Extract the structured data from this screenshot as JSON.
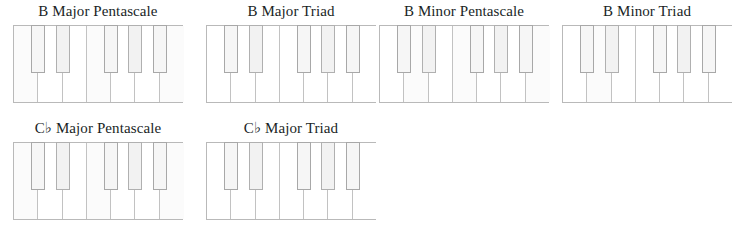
{
  "page": {
    "background_color": "#ffffff",
    "text_color": "#201f1f",
    "white_key_color": "#ffffff",
    "black_key_color": "#f2f2f2",
    "key_border_color": "#b9b9b9"
  },
  "layout": {
    "rows": 2,
    "columns_row1": 4,
    "columns_row2": 2,
    "keyboard_white_keys": 7,
    "keyboard_black_keys": 5
  },
  "diagrams": [
    {
      "id": "b-major-pentascale",
      "title": "B Major Pentascale",
      "root": "B",
      "quality": "Major",
      "kind": "Pentascale",
      "left": 13,
      "top": 2,
      "notes": [
        "B",
        "C♯",
        "D♯",
        "E",
        "F♯"
      ],
      "white_keys_on": [
        0,
        3,
        6
      ],
      "black_keys_on": [
        0,
        2,
        4
      ]
    },
    {
      "id": "b-major-triad",
      "title": "B Major Triad",
      "root": "B",
      "quality": "Major",
      "kind": "Triad",
      "left": 206,
      "top": 2,
      "notes": [
        "B",
        "D♯",
        "F♯"
      ],
      "white_keys_on": [],
      "black_keys_on": [
        0,
        2,
        4
      ]
    },
    {
      "id": "b-minor-pentascale",
      "title": "B Minor Pentascale",
      "root": "B",
      "quality": "Minor",
      "kind": "Pentascale",
      "left": 379,
      "top": 2,
      "notes": [
        "B",
        "C♯",
        "D",
        "E",
        "F♯"
      ],
      "white_keys_on": [
        1,
        3,
        6
      ],
      "black_keys_on": [
        0,
        2,
        4
      ]
    },
    {
      "id": "b-minor-triad",
      "title": "B Minor Triad",
      "root": "B",
      "quality": "Minor",
      "kind": "Triad",
      "left": 562,
      "top": 2,
      "notes": [
        "B",
        "D",
        "F♯"
      ],
      "white_keys_on": [
        1
      ],
      "black_keys_on": [
        0,
        2,
        4
      ]
    },
    {
      "id": "cb-major-pentascale",
      "title": "C♭ Major Pentascale",
      "root": "C♭",
      "quality": "Major",
      "kind": "Pentascale",
      "left": 13,
      "top": 119,
      "notes": [
        "C♭",
        "D♭",
        "E♭",
        "F♭",
        "G♭"
      ],
      "white_keys_on": [
        0,
        3,
        6
      ],
      "black_keys_on": [
        0,
        2,
        4
      ]
    },
    {
      "id": "cb-major-triad",
      "title": "C♭ Major Triad",
      "root": "C♭",
      "quality": "Major",
      "kind": "Triad",
      "left": 206,
      "top": 119,
      "notes": [
        "C♭",
        "E♭",
        "G♭"
      ],
      "white_keys_on": [],
      "black_keys_on": [
        0,
        2,
        4
      ]
    }
  ],
  "keyboard_geometry": {
    "white_key_width": 24.28,
    "black_key_width": 14,
    "black_key_offsets": [
      17.2,
      41.5,
      90.0,
      114.3,
      138.6
    ]
  }
}
